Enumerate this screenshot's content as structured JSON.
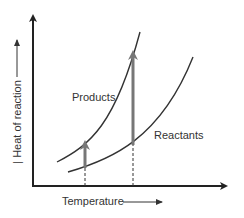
{
  "diagram": {
    "y_axis_label": "Heat of reaction",
    "y_axis_prefix": "|",
    "x_axis_label": "Temperature",
    "curves": [
      {
        "name": "Products",
        "label": "Products"
      },
      {
        "name": "Reactants",
        "label": "Reactants"
      }
    ],
    "colors": {
      "axis": "#222222",
      "curve": "#333333",
      "arrow": "#777777",
      "text": "#333333"
    }
  }
}
